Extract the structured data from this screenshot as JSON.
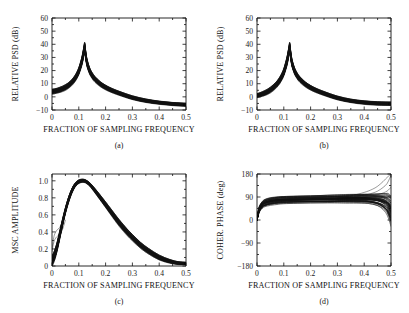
{
  "figure": {
    "background_color": "#ffffff",
    "ink_color": "#111111",
    "panel_count": 4
  },
  "chart_data": [
    {
      "type": "line",
      "panel_label": "(a)",
      "title": "",
      "xlabel": "FRACTION OF SAMPLING FREQUENCY",
      "ylabel": "RELATIVE PSD (dB)",
      "xlim": [
        0,
        0.5
      ],
      "ylim": [
        -10,
        60
      ],
      "xticks": [
        0,
        0.1,
        0.2,
        0.3,
        0.4,
        0.5
      ],
      "xticklabels": [
        "0",
        "0.1",
        "0.2",
        "0.3",
        "0.4",
        "0.5"
      ],
      "yticks": [
        -10,
        0,
        10,
        20,
        30,
        40,
        50,
        60
      ],
      "yticklabels": [
        "-10",
        "0",
        "10",
        "20",
        "30",
        "40",
        "50",
        "60"
      ],
      "grid": false,
      "legend": "none",
      "description": "Dense overlay of many PSD estimate realizations forming a thick black band; sharp resonance peak near 0.122 reaching about 38 dB, baseline near 4 dB at zero frequency decaying to about -6 dB at 0.5.",
      "peak_x": 0.122,
      "peak_y": 38,
      "n_traces": 40,
      "x": [
        0.0,
        0.01,
        0.02,
        0.03,
        0.04,
        0.05,
        0.06,
        0.07,
        0.08,
        0.09,
        0.1,
        0.11,
        0.115,
        0.12,
        0.122,
        0.125,
        0.13,
        0.14,
        0.15,
        0.16,
        0.18,
        0.2,
        0.22,
        0.25,
        0.3,
        0.35,
        0.4,
        0.45,
        0.5
      ],
      "y": [
        4.0,
        4.3,
        4.8,
        5.4,
        6.2,
        7.2,
        8.5,
        10.2,
        12.4,
        15.4,
        19.6,
        26.0,
        30.5,
        36.0,
        38.0,
        33.0,
        26.5,
        20.0,
        16.2,
        13.5,
        9.8,
        7.2,
        5.2,
        2.8,
        -0.6,
        -2.9,
        -4.4,
        -5.4,
        -6.0
      ],
      "band_halfwidth": [
        1.6,
        1.6,
        1.6,
        1.7,
        1.7,
        1.8,
        1.8,
        1.9,
        2.0,
        2.1,
        2.3,
        2.6,
        2.8,
        3.0,
        3.0,
        2.8,
        2.5,
        2.1,
        1.9,
        1.8,
        1.6,
        1.5,
        1.4,
        1.3,
        1.2,
        1.1,
        1.0,
        1.0,
        1.0
      ]
    },
    {
      "type": "line",
      "panel_label": "(b)",
      "title": "",
      "xlabel": "FRACTION OF SAMPLING FREQUENCY",
      "ylabel": "RELATIVE PSD (dB)",
      "xlim": [
        0,
        0.5
      ],
      "ylim": [
        -10,
        60
      ],
      "xticks": [
        0,
        0.1,
        0.2,
        0.3,
        0.4,
        0.5
      ],
      "xticklabels": [
        "0",
        "0.1",
        "0.2",
        "0.3",
        "0.4",
        "0.5"
      ],
      "yticks": [
        -10,
        0,
        10,
        20,
        30,
        40,
        50,
        60
      ],
      "yticklabels": [
        "-10",
        "0",
        "10",
        "20",
        "30",
        "40",
        "50",
        "60"
      ],
      "grid": false,
      "legend": "none",
      "description": "Same PSD family as panel (a) but the low-frequency baseline starts near 1 dB instead of 4 dB; identical sharp resonance near 0.122 peaking about 38 dB and decaying to about -5 dB at 0.5.",
      "peak_x": 0.122,
      "peak_y": 38,
      "n_traces": 40,
      "x": [
        0.0,
        0.01,
        0.02,
        0.03,
        0.04,
        0.05,
        0.06,
        0.07,
        0.08,
        0.09,
        0.1,
        0.11,
        0.115,
        0.12,
        0.122,
        0.125,
        0.13,
        0.14,
        0.15,
        0.16,
        0.18,
        0.2,
        0.22,
        0.25,
        0.3,
        0.35,
        0.4,
        0.45,
        0.5
      ],
      "y": [
        1.0,
        1.5,
        2.2,
        3.0,
        4.0,
        5.3,
        6.9,
        8.8,
        11.2,
        14.4,
        18.8,
        25.6,
        30.2,
        35.8,
        38.0,
        33.0,
        26.3,
        19.8,
        16.0,
        13.3,
        9.6,
        7.0,
        5.0,
        2.6,
        -0.8,
        -3.0,
        -4.3,
        -5.0,
        -5.2
      ],
      "band_halfwidth": [
        1.3,
        1.4,
        1.5,
        1.6,
        1.7,
        1.8,
        1.9,
        2.0,
        2.1,
        2.2,
        2.4,
        2.7,
        2.9,
        3.0,
        3.0,
        2.8,
        2.5,
        2.1,
        1.9,
        1.8,
        1.6,
        1.5,
        1.4,
        1.3,
        1.2,
        1.1,
        1.1,
        1.1,
        1.1
      ]
    },
    {
      "type": "line",
      "panel_label": "(c)",
      "title": "",
      "xlabel": "FRACTION OF SAMPLING FREQUENCY",
      "ylabel": "MSC AMPLITUDE",
      "xlim": [
        0,
        0.5
      ],
      "ylim": [
        0,
        1.08
      ],
      "xticks": [
        0,
        0.1,
        0.2,
        0.3,
        0.4,
        0.5
      ],
      "xticklabels": [
        "0",
        "0.1",
        "0.2",
        "0.3",
        "0.4",
        "0.5"
      ],
      "yticks": [
        0,
        0.2,
        0.4,
        0.6,
        0.8,
        1.0
      ],
      "yticklabels": [
        "0",
        "0.2",
        "0.4",
        "0.6",
        "0.8",
        "1.0"
      ],
      "grid": false,
      "legend": "none",
      "description": "Magnitude squared coherence band rising from near 0.05 at zero frequency to a broad maximum of 1.0 near 0.12, then decaying smoothly toward 0.03 at 0.5. A few thin outlier traces branch upward near zero frequency reaching about 0.42 at 0.02.",
      "peak_x": 0.12,
      "peak_y": 1.0,
      "n_traces": 40,
      "x": [
        0.0,
        0.01,
        0.02,
        0.03,
        0.04,
        0.05,
        0.06,
        0.07,
        0.08,
        0.09,
        0.1,
        0.11,
        0.12,
        0.13,
        0.14,
        0.15,
        0.17,
        0.2,
        0.22,
        0.25,
        0.28,
        0.3,
        0.33,
        0.36,
        0.4,
        0.44,
        0.47,
        0.5
      ],
      "y": [
        0.06,
        0.13,
        0.24,
        0.38,
        0.52,
        0.65,
        0.76,
        0.85,
        0.92,
        0.965,
        0.99,
        1.0,
        1.0,
        0.985,
        0.96,
        0.925,
        0.845,
        0.72,
        0.635,
        0.51,
        0.4,
        0.335,
        0.245,
        0.175,
        0.1,
        0.055,
        0.035,
        0.03
      ],
      "band_halfwidth": [
        0.055,
        0.05,
        0.045,
        0.04,
        0.035,
        0.03,
        0.028,
        0.025,
        0.022,
        0.02,
        0.018,
        0.016,
        0.015,
        0.016,
        0.018,
        0.02,
        0.024,
        0.028,
        0.03,
        0.032,
        0.032,
        0.032,
        0.03,
        0.028,
        0.024,
        0.018,
        0.014,
        0.012
      ],
      "outlier_trace": {
        "x": [
          0.0,
          0.005,
          0.01,
          0.018,
          0.025,
          0.032,
          0.04,
          0.05
        ],
        "y": [
          0.2,
          0.31,
          0.375,
          0.42,
          0.44,
          0.47,
          0.53,
          0.655
        ]
      }
    },
    {
      "type": "line",
      "panel_label": "(d)",
      "title": "",
      "xlabel": "FRACTION OF SAMPLING FREQUENCY",
      "ylabel": "COHER. PHASE (deg)",
      "xlim": [
        0,
        0.5
      ],
      "ylim": [
        -180,
        180
      ],
      "xticks": [
        0,
        0.1,
        0.2,
        0.3,
        0.4,
        0.5
      ],
      "xticklabels": [
        "0",
        "0.1",
        "0.2",
        "0.3",
        "0.4",
        "0.5"
      ],
      "yticks": [
        -180,
        -90,
        0,
        90,
        180
      ],
      "yticklabels": [
        "-180",
        "-90",
        "0",
        "90",
        "180"
      ],
      "grid": false,
      "legend": "none",
      "description": "Coherence phase band starting at 0 degrees at zero frequency, rising steeply to a plateau near 80 degrees across the mid band, then fanning out sharply past 0.4 where several thin traces climb toward 180 degrees while the main band falls toward 30 degrees at 0.5.",
      "n_traces": 40,
      "x": [
        0.0,
        0.005,
        0.01,
        0.02,
        0.03,
        0.05,
        0.08,
        0.1,
        0.15,
        0.2,
        0.25,
        0.3,
        0.33,
        0.36,
        0.4,
        0.42,
        0.44,
        0.46,
        0.48,
        0.49,
        0.5
      ],
      "y": [
        0.0,
        28.0,
        45.0,
        60.0,
        67.0,
        73.0,
        77.0,
        78.5,
        80.0,
        81.0,
        82.0,
        83.0,
        83.5,
        84.0,
        84.0,
        83.0,
        81.0,
        77.0,
        68.0,
        58.0,
        38.0
      ],
      "band_halfwidth": [
        2.0,
        8.0,
        10.0,
        11.0,
        11.5,
        12.0,
        12.0,
        12.0,
        12.0,
        12.0,
        12.5,
        13.0,
        13.5,
        14.0,
        15.0,
        16.0,
        18.0,
        22.0,
        30.0,
        38.0,
        48.0
      ],
      "fan_traces": [
        {
          "x": [
            0.3,
            0.35,
            0.4,
            0.43,
            0.45,
            0.47,
            0.48,
            0.49,
            0.497,
            0.5
          ],
          "y": [
            88,
            95,
            108,
            120,
            132,
            150,
            161,
            171,
            177,
            179
          ]
        },
        {
          "x": [
            0.3,
            0.35,
            0.4,
            0.43,
            0.45,
            0.47,
            0.485,
            0.495,
            0.5
          ],
          "y": [
            85,
            89,
            97,
            105,
            113,
            127,
            142,
            163,
            176
          ]
        },
        {
          "x": [
            0.3,
            0.36,
            0.41,
            0.44,
            0.46,
            0.48,
            0.49,
            0.5
          ],
          "y": [
            84,
            87,
            92,
            97,
            102,
            110,
            117,
            128
          ]
        },
        {
          "x": [
            0.3,
            0.36,
            0.42,
            0.45,
            0.47,
            0.49,
            0.5
          ],
          "y": [
            83,
            85,
            88,
            90,
            92,
            94,
            96
          ]
        },
        {
          "x": [
            0.3,
            0.36,
            0.42,
            0.45,
            0.47,
            0.49,
            0.5
          ],
          "y": [
            82,
            82,
            80,
            77,
            73,
            66,
            58
          ]
        },
        {
          "x": [
            0.3,
            0.36,
            0.42,
            0.45,
            0.47,
            0.49,
            0.5
          ],
          "y": [
            80,
            78,
            73,
            67,
            60,
            46,
            30
          ]
        },
        {
          "x": [
            0.3,
            0.36,
            0.42,
            0.45,
            0.47,
            0.49,
            0.5
          ],
          "y": [
            78,
            75,
            68,
            60,
            51,
            34,
            14
          ]
        }
      ]
    }
  ],
  "panels": {
    "a": {
      "label": "(a)",
      "ylabel": "RELATIVE PSD (dB)",
      "xlabel": "FRACTION OF SAMPLING FREQUENCY"
    },
    "b": {
      "label": "(b)",
      "ylabel": "RELATIVE PSD (dB)",
      "xlabel": "FRACTION OF SAMPLING FREQUENCY"
    },
    "c": {
      "label": "(c)",
      "ylabel": "MSC AMPLITUDE",
      "xlabel": "FRACTION OF SAMPLING FREQUENCY"
    },
    "d": {
      "label": "(d)",
      "ylabel": "COHER. PHASE (deg)",
      "xlabel": "FRACTION OF SAMPLING FREQUENCY"
    }
  }
}
